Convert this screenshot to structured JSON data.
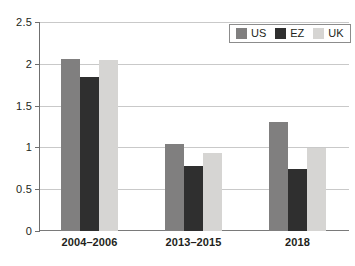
{
  "chart_data": {
    "type": "bar",
    "title": "",
    "subtitle": "",
    "xlabel": "",
    "ylabel": "",
    "categories": [
      "2004–2006",
      "2013–2015",
      "2018"
    ],
    "series": [
      {
        "name": "US",
        "color": "#807f7f",
        "values": [
          2.07,
          1.05,
          1.31
        ]
      },
      {
        "name": "EZ",
        "color": "#2f2f2f",
        "values": [
          1.85,
          0.78,
          0.75
        ]
      },
      {
        "name": "UK",
        "color": "#d6d5d3",
        "values": [
          2.05,
          0.94,
          1.0
        ]
      }
    ],
    "ylim": [
      0,
      2.5
    ],
    "yticks": [
      0,
      0.5,
      1,
      1.5,
      2,
      2.5
    ],
    "ytick_labels": [
      "0",
      "0.5",
      "1",
      "1.5",
      "2",
      "2.5"
    ],
    "grid": true,
    "grid_axis": "y",
    "legend_position": "top-right",
    "legend_entries": [
      "US",
      "EZ",
      "UK"
    ]
  }
}
